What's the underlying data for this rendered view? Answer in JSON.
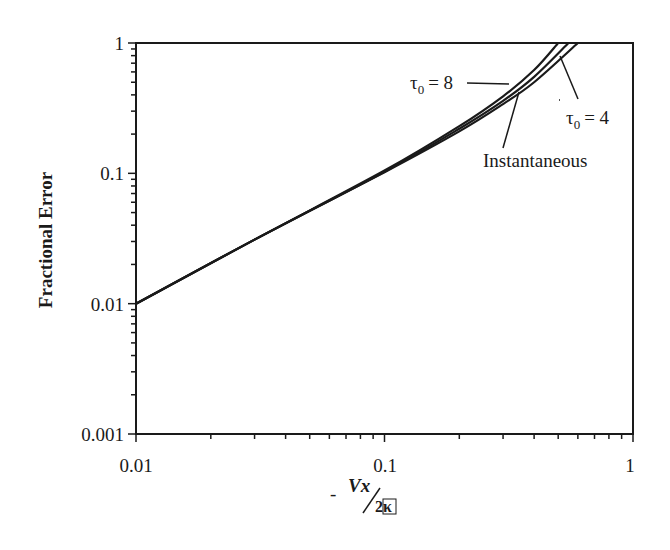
{
  "chart_data": {
    "type": "line",
    "title": "",
    "xlabel": "- Vx / 2κ",
    "ylabel": "Fractional Error",
    "xscale": "log",
    "yscale": "log",
    "xlim": [
      0.01,
      1
    ],
    "ylim": [
      0.001,
      1
    ],
    "x_ticks": [
      "0.01",
      "0.1",
      "1"
    ],
    "y_ticks": [
      "0.001",
      "0.01",
      "0.1",
      "1"
    ],
    "grid": false,
    "legend": "inline annotations",
    "series": [
      {
        "name": "τ0 = 8",
        "x": [
          0.01,
          0.03,
          0.1,
          0.2,
          0.3,
          0.4,
          0.5
        ],
        "y": [
          0.01,
          0.031,
          0.105,
          0.23,
          0.39,
          0.62,
          1.0
        ]
      },
      {
        "name": "Instantaneous",
        "x": [
          0.01,
          0.03,
          0.1,
          0.2,
          0.3,
          0.4,
          0.55
        ],
        "y": [
          0.01,
          0.031,
          0.103,
          0.22,
          0.36,
          0.55,
          1.0
        ]
      },
      {
        "name": "τ0 = 4",
        "x": [
          0.01,
          0.03,
          0.1,
          0.2,
          0.3,
          0.4,
          0.6
        ],
        "y": [
          0.01,
          0.031,
          0.102,
          0.21,
          0.34,
          0.5,
          1.0
        ]
      }
    ],
    "annotations": [
      "τ0 = 8",
      "Instantaneous",
      "τ0 = 4"
    ]
  },
  "labels": {
    "ylabel": "Fractional Error",
    "x_minus": "-",
    "x_num": "Vx",
    "x_den": "2κ",
    "ann_tau8_tau": "τ",
    "ann_tau8_sub": "0",
    "ann_tau8_val": "= 8",
    "ann_tau4_tau": "τ",
    "ann_tau4_sub": "0",
    "ann_tau4_val": "= 4",
    "ann_inst": "Instantaneous",
    "xt0": "0.01",
    "xt1": "0.1",
    "xt2": "1",
    "yt0": "1",
    "yt1": "0.1",
    "yt2": "0.01",
    "yt3": "0.001"
  }
}
